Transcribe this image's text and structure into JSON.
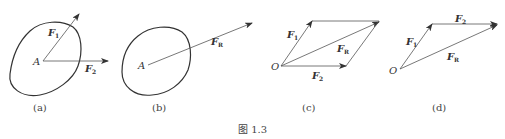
{
  "figure": {
    "caption": "图 1.3",
    "panels": [
      {
        "id": "a",
        "label": "(a)",
        "point": "A",
        "vectors": [
          {
            "name": "F",
            "subscript": "1"
          },
          {
            "name": "F",
            "subscript": "2"
          }
        ]
      },
      {
        "id": "b",
        "label": "(b)",
        "point": "A",
        "vectors": [
          {
            "name": "F",
            "subscript": "R"
          }
        ]
      },
      {
        "id": "c",
        "label": "(c)",
        "point": "O",
        "vectors": [
          {
            "name": "F",
            "subscript": "1"
          },
          {
            "name": "F",
            "subscript": "2"
          },
          {
            "name": "F",
            "subscript": "R"
          }
        ]
      },
      {
        "id": "d",
        "label": "(d)",
        "point": "O",
        "vectors": [
          {
            "name": "F",
            "subscript": "1"
          },
          {
            "name": "F",
            "subscript": "2"
          },
          {
            "name": "F",
            "subscript": "R"
          }
        ]
      }
    ]
  }
}
